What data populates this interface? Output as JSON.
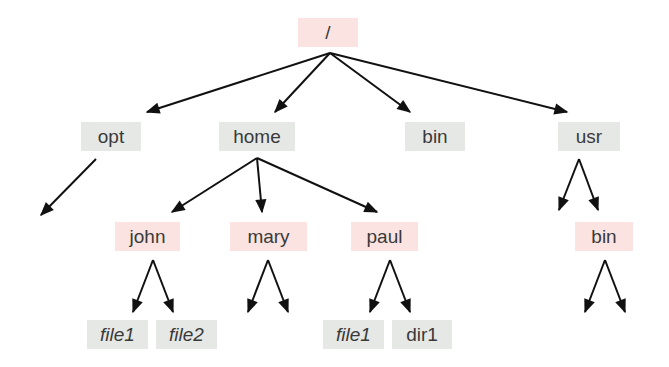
{
  "diagram": {
    "type": "directory-tree",
    "colors": {
      "dir_highlight": "#fbe3e1",
      "dir_plain": "#e6e8e6",
      "arrow": "#111111",
      "text": "#3a3a3a"
    },
    "nodes": {
      "root": {
        "label": "/",
        "style": "pink"
      },
      "opt": {
        "label": "opt",
        "style": "gray"
      },
      "home": {
        "label": "home",
        "style": "gray"
      },
      "bin": {
        "label": "bin",
        "style": "gray"
      },
      "usr": {
        "label": "usr",
        "style": "gray"
      },
      "john": {
        "label": "john",
        "style": "pink"
      },
      "mary": {
        "label": "mary",
        "style": "pink"
      },
      "paul": {
        "label": "paul",
        "style": "pink"
      },
      "usr_bin": {
        "label": "bin",
        "style": "pink"
      },
      "john_file1": {
        "label": "file1",
        "style": "gray-italic"
      },
      "john_file2": {
        "label": "file2",
        "style": "gray-italic"
      },
      "paul_file1": {
        "label": "file1",
        "style": "gray-italic"
      },
      "paul_dir1": {
        "label": "dir1",
        "style": "gray"
      }
    },
    "edges": [
      [
        "root",
        "opt"
      ],
      [
        "root",
        "home"
      ],
      [
        "root",
        "bin"
      ],
      [
        "root",
        "usr"
      ],
      [
        "opt",
        "(unlabeled)"
      ],
      [
        "home",
        "john"
      ],
      [
        "home",
        "mary"
      ],
      [
        "home",
        "paul"
      ],
      [
        "usr",
        "(unlabeled)"
      ],
      [
        "usr",
        "usr_bin"
      ],
      [
        "john",
        "john_file1"
      ],
      [
        "john",
        "john_file2"
      ],
      [
        "mary",
        "(unlabeled)"
      ],
      [
        "mary",
        "(unlabeled)"
      ],
      [
        "paul",
        "paul_file1"
      ],
      [
        "paul",
        "paul_dir1"
      ],
      [
        "usr_bin",
        "(unlabeled)"
      ],
      [
        "usr_bin",
        "(unlabeled)"
      ]
    ]
  }
}
